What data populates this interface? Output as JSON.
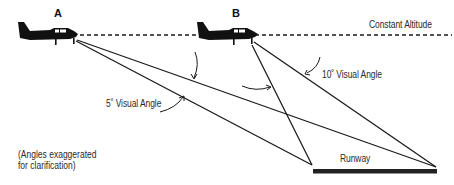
{
  "diagram": {
    "planes": [
      {
        "id": "A",
        "label": "A"
      },
      {
        "id": "B",
        "label": "B"
      }
    ],
    "altitude_label": "Constant Altitude",
    "angle_labels": {
      "small": "5˚ Visual Angle",
      "large": "10˚ Visual Angle"
    },
    "runway_label": "Runway",
    "note_line1": "(Angles exaggerated",
    "note_line2": "for clarification)",
    "colors": {
      "ink": "#1a1a1a",
      "text": "#2a2a2a",
      "background": "#ffffff"
    }
  }
}
